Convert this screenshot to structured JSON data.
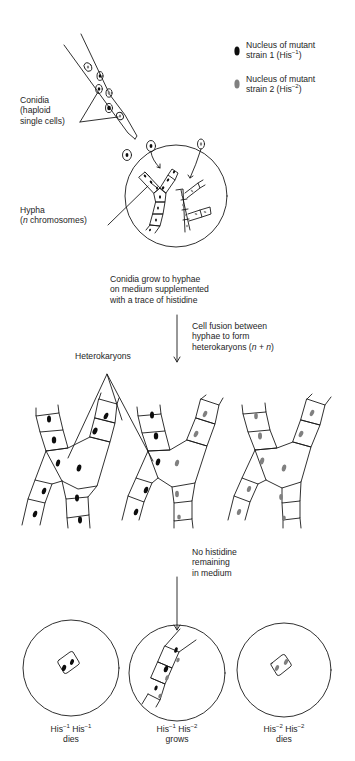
{
  "legend": {
    "items": [
      {
        "line1": "Nucleus of mutant",
        "line2_prefix": "strain 1 (His",
        "sup": "−1",
        "line2_suffix": ")",
        "color": "#0d0d0d"
      },
      {
        "line1": "Nucleus of mutant",
        "line2_prefix": "strain 2 (His",
        "sup": "−2",
        "line2_suffix": ")",
        "color": "#808080"
      }
    ]
  },
  "labels": {
    "conidia": [
      "Conidia",
      "(haploid",
      "single cells)"
    ],
    "hypha_line1": "Hypha",
    "hypha_line2_italic": "n",
    "hypha_line2_rest": " chromosomes)",
    "hypha_line2_open": "(",
    "heterokaryons": "Heterokaryons"
  },
  "steps": {
    "step1": [
      "Conidia grow to hyphae",
      "on medium supplemented",
      "with a trace of histidine"
    ],
    "step2": [
      "Cell fusion between",
      "hyphae to form"
    ],
    "step2_line3_prefix": "heterokaryons (",
    "step2_n1": "n",
    "step2_plus": " + ",
    "step2_n2": "n",
    "step2_close": ")",
    "step3": [
      "No histidine",
      "remaining",
      "in medium"
    ]
  },
  "outcomes": [
    {
      "genotype_a": "His",
      "sup_a": "−1",
      "genotype_b": " His",
      "sup_b": "−1",
      "result": "dies"
    },
    {
      "genotype_a": "His",
      "sup_a": "−1",
      "genotype_b": " His",
      "sup_b": "−2",
      "result": "grows"
    },
    {
      "genotype_a": "His",
      "sup_a": "−2",
      "genotype_b": " His",
      "sup_b": "−2",
      "result": "dies"
    }
  ],
  "colors": {
    "nucleus_strain1": "#0d0d0d",
    "nucleus_strain2": "#808080",
    "line": "#1a1a1a"
  }
}
